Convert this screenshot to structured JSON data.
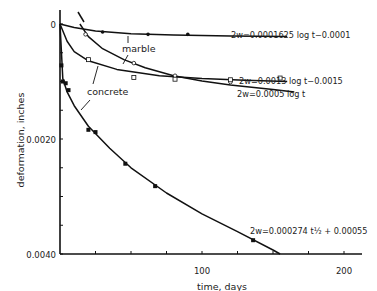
{
  "chart_data": {
    "type": "line",
    "title": "",
    "xlabel": "time, days",
    "ylabel": "deformation, inches",
    "xlim": [
      0,
      212
    ],
    "ylim": [
      0,
      0.004
    ],
    "y_inverted": true,
    "grid": false,
    "x_ticks": [
      0,
      25,
      50,
      75,
      100,
      125,
      150,
      175,
      200
    ],
    "x_tick_labels": [
      {
        "value": 100,
        "label": "100"
      },
      {
        "value": 200,
        "label": "200"
      }
    ],
    "y_ticks": [
      0,
      0.0005,
      0.001,
      0.0015,
      0.002,
      0.0025,
      0.003,
      0.0035,
      0.004
    ],
    "y_tick_labels": [
      {
        "value": 0,
        "label": "0"
      },
      {
        "value": 0.002,
        "label": "0.0020"
      },
      {
        "value": 0.004,
        "label": "0.0040"
      }
    ],
    "annotations": [
      {
        "text": "marble",
        "target": "marble curve (2w=0.0013 log t − 0.0015)"
      },
      {
        "text": "concrete",
        "target": "concrete curves (2w=0.0005 log t and 2w=0.000274 t^1/2 + 0.00055)"
      }
    ],
    "series": [
      {
        "name": "2w=0.0001625 log t − 0.0001",
        "material": "marble",
        "marker": "filled-circle",
        "points": [
          [
            30,
            0.00014
          ],
          [
            62,
            0.00018
          ],
          [
            90,
            0.00018
          ]
        ],
        "curve": [
          [
            0,
            0.0
          ],
          [
            10,
            6e-05
          ],
          [
            25,
            0.00012
          ],
          [
            50,
            0.00017
          ],
          [
            80,
            0.00019
          ],
          [
            120,
            0.00021
          ],
          [
            160,
            0.00022
          ]
        ]
      },
      {
        "name": "2w=0.0013 log t − 0.0015",
        "material": "marble",
        "marker": "open-circle",
        "points": [
          [
            18,
            0.00018
          ],
          [
            52,
            0.00068
          ],
          [
            81,
            0.0009
          ],
          [
            120,
            0.00101
          ]
        ],
        "curve": [
          [
            14,
            0.0
          ],
          [
            20,
            0.00022
          ],
          [
            30,
            0.00043
          ],
          [
            45,
            0.00062
          ],
          [
            60,
            0.00076
          ],
          [
            80,
            0.0009
          ],
          [
            100,
            0.00099
          ],
          [
            120,
            0.00106
          ],
          [
            150,
            0.00114
          ],
          [
            165,
            0.00118
          ]
        ]
      },
      {
        "name": "2w=0.0005 log t",
        "material": "concrete",
        "marker": "open-square",
        "points": [
          [
            20,
            0.00062
          ],
          [
            52,
            0.00093
          ],
          [
            81,
            0.00096
          ],
          [
            120,
            0.00097
          ],
          [
            155,
            0.00094
          ]
        ],
        "curve": [
          [
            0,
            0.0
          ],
          [
            5,
            0.0003
          ],
          [
            10,
            0.00048
          ],
          [
            20,
            0.00064
          ],
          [
            40,
            0.00079
          ],
          [
            70,
            0.0009
          ],
          [
            100,
            0.00095
          ],
          [
            130,
            0.00098
          ],
          [
            160,
            0.001
          ]
        ]
      },
      {
        "name": "2w=0.000274 t^(1/2) + 0.00055",
        "material": "concrete",
        "marker": "filled-square",
        "points": [
          [
            1,
            0.00072
          ],
          [
            2,
            0.001
          ],
          [
            4,
            0.00103
          ],
          [
            6,
            0.00115
          ],
          [
            20,
            0.00184
          ],
          [
            25,
            0.00188
          ],
          [
            46,
            0.00243
          ],
          [
            67,
            0.00282
          ],
          [
            136,
            0.00376
          ]
        ],
        "curve": [
          [
            0,
            0.0
          ],
          [
            2,
            0.00095
          ],
          [
            5,
            0.00118
          ],
          [
            10,
            0.00142
          ],
          [
            20,
            0.00178
          ],
          [
            35,
            0.00216
          ],
          [
            50,
            0.0025
          ],
          [
            75,
            0.00294
          ],
          [
            100,
            0.0033
          ],
          [
            125,
            0.00361
          ],
          [
            150,
            0.00393
          ],
          [
            155,
            0.004
          ]
        ]
      }
    ]
  }
}
